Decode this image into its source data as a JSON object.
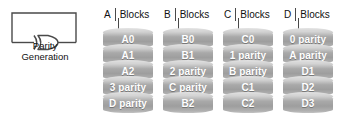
{
  "figure": {
    "parity_generator": {
      "caption": "Parity\nGeneration",
      "gate_icon": "xor-gate-icon",
      "feedback_loop": true
    },
    "blocks_label": "Blocks",
    "disks": [
      {
        "letter": "A",
        "blocks": [
          "A0",
          "A1",
          "A2",
          "3 parity",
          "D parity"
        ]
      },
      {
        "letter": "B",
        "blocks": [
          "B0",
          "B1",
          "2 parity",
          "C parity",
          "B2"
        ]
      },
      {
        "letter": "C",
        "blocks": [
          "C0",
          "1 parity",
          "B parity",
          "C1",
          "C2"
        ]
      },
      {
        "letter": "D",
        "blocks": [
          "0 parity",
          "A parity",
          "D1",
          "D2",
          "D3"
        ]
      }
    ],
    "colors": {
      "disk_fill": "#a9a9a9",
      "disk_highlight": "#d9d9d9",
      "line": "#4a4a4a",
      "text": "#111111",
      "block_text": "#ffffff",
      "background": "#ffffff"
    }
  }
}
